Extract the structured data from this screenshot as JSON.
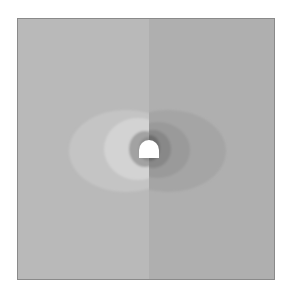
{
  "figure": {
    "colors": {
      "border": "#8a8a8a",
      "left_background": "#b9b9b9",
      "right_background": "#afafaf",
      "left_outer_lobe": "#c4c4c4",
      "left_inner_lobe": "#d3d3d3",
      "left_near_ring_1": "#a2a2a2",
      "left_near_ring_2": "#8e8e8e",
      "right_outer_lobe": "#a5a5a5",
      "right_mid_lobe": "#9a9a9a",
      "right_near_ring_1": "#888888",
      "right_near_ring_2": "#6e6e6e",
      "tunnel": "#ffffff"
    }
  }
}
